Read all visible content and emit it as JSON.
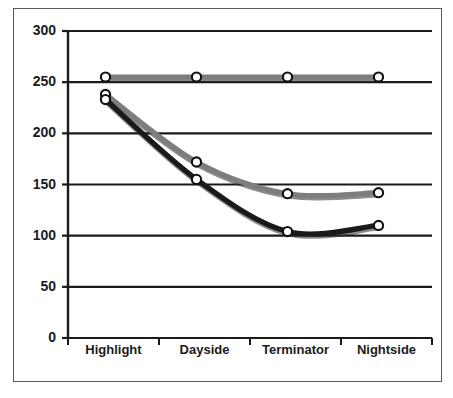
{
  "chart_data": {
    "type": "line",
    "title": "",
    "subtitle": "",
    "xlabel": "",
    "ylabel": "",
    "categories": [
      "Highlight",
      "Dayside",
      "Terminator",
      "Nightside"
    ],
    "ylim": [
      0,
      300
    ],
    "yticks": [
      0,
      50,
      100,
      150,
      200,
      250,
      300
    ],
    "ytick_labels": [
      "0",
      "50",
      "100",
      "150",
      "200",
      "250",
      "300"
    ],
    "grid": true,
    "grid_axis": "y",
    "legend": "none",
    "smoothed": true,
    "marker": "open-circle",
    "series": [
      {
        "name": "series-flat",
        "color": "#7d7d7d",
        "values": [
          255,
          255,
          255,
          255
        ]
      },
      {
        "name": "series-gray",
        "color": "#7d7d7d",
        "values": [
          238,
          172,
          141,
          142
        ]
      },
      {
        "name": "series-black",
        "color": "#1a1a1a",
        "values": [
          233,
          155,
          104,
          110
        ]
      }
    ]
  },
  "colors": {
    "frame": "#5a5a5a",
    "axis": "#1b1b1b",
    "grid": "#1b1b1b",
    "series_gray": "#7d7d7d",
    "series_black": "#1a1a1a",
    "marker_fill": "#ffffff",
    "marker_stroke": "#111111",
    "background": "#ffffff"
  },
  "axis": {
    "y_top_label": "300",
    "y_bottom_label": "0"
  }
}
